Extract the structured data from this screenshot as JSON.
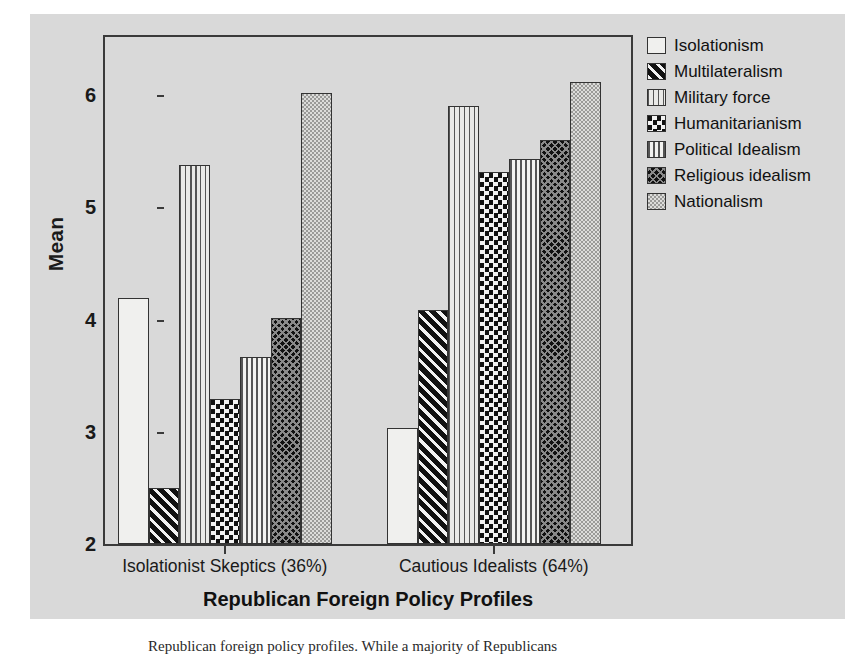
{
  "chart_data": {
    "type": "bar",
    "title": "",
    "xlabel": "Republican Foreign Policy Profiles",
    "ylabel": "Mean",
    "ylim": [
      2,
      6.55
    ],
    "yticks": [
      2,
      3,
      4,
      5,
      6
    ],
    "ytick_labels": [
      "2",
      "3",
      "4",
      "5",
      "6"
    ],
    "grid": false,
    "legend_position": "right",
    "categories": [
      "Isolationist Skeptics (36%)",
      "Cautious Idealists (64%)"
    ],
    "series": [
      {
        "name": "Isolationism",
        "pattern": "empty-white",
        "values": [
          4.19,
          3.03
        ]
      },
      {
        "name": "Multilateralism",
        "pattern": "diagonal-stripes",
        "values": [
          2.5,
          4.09
        ]
      },
      {
        "name": "Military force",
        "pattern": "vertical-dots",
        "values": [
          5.38,
          5.9
        ]
      },
      {
        "name": "Humanitarianism",
        "pattern": "checkerboard",
        "values": [
          3.29,
          5.32
        ]
      },
      {
        "name": "Political Idealism",
        "pattern": "vertical-stripes",
        "values": [
          3.67,
          5.43
        ]
      },
      {
        "name": "Religious idealism",
        "pattern": "dense-crosshatch",
        "values": [
          4.01,
          5.6
        ]
      },
      {
        "name": "Nationalism",
        "pattern": "fine-gray-stipple",
        "values": [
          6.02,
          6.12
        ]
      }
    ]
  },
  "legend": {
    "items": [
      {
        "label": "Isolationism"
      },
      {
        "label": "Multilateralism"
      },
      {
        "label": "Military force"
      },
      {
        "label": "Humanitarianism"
      },
      {
        "label": "Political Idealism"
      },
      {
        "label": "Religious idealism"
      },
      {
        "label": "Nationalism"
      }
    ]
  },
  "colors": {
    "figure_background": "#d9d9d9",
    "page_background": "#ffffff",
    "axis": "#3a3a3a",
    "text": "#1a1a1a"
  },
  "caption": {
    "text": "Republican foreign policy profiles. While a majority of Republicans"
  }
}
